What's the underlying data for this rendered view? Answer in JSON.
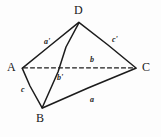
{
  "figure": {
    "name": "tetrahedron-abcd-diagram",
    "style": "hand-drawn pencil line diagram",
    "background_color": "#fdfdfd",
    "ink_color": "#1c1c1c",
    "canvas": {
      "width": 161,
      "height": 137
    }
  },
  "vertices": [
    {
      "id": "A",
      "label": "A",
      "x": 22,
      "y": 68,
      "label_x": 7,
      "label_y": 61
    },
    {
      "id": "B",
      "label": "B",
      "x": 42,
      "y": 108,
      "label_x": 36,
      "label_y": 112
    },
    {
      "id": "C",
      "label": "C",
      "x": 136,
      "y": 68,
      "label_x": 142,
      "label_y": 61
    },
    {
      "id": "D",
      "label": "D",
      "x": 79,
      "y": 22,
      "label_x": 74,
      "label_y": 4
    }
  ],
  "edges": [
    {
      "id": "AD",
      "from": "A",
      "to": "D",
      "style": "solid",
      "label": "a'"
    },
    {
      "id": "DC",
      "from": "D",
      "to": "C",
      "style": "solid",
      "label": "c'"
    },
    {
      "id": "AC",
      "from": "A",
      "to": "C",
      "style": "dashed",
      "label": "b"
    },
    {
      "id": "BD",
      "from": "B",
      "to": "D",
      "style": "solid",
      "label": "b'"
    },
    {
      "id": "AB",
      "from": "A",
      "to": "B",
      "style": "solid",
      "label": "c"
    },
    {
      "id": "BC",
      "from": "B",
      "to": "C",
      "style": "solid",
      "label": "a"
    }
  ],
  "edge_labels": [
    {
      "for_edge": "AD",
      "text": "a'",
      "x": 44,
      "y": 38
    },
    {
      "for_edge": "DC",
      "text": "c'",
      "x": 112,
      "y": 36
    },
    {
      "for_edge": "AC",
      "text": "b",
      "x": 90,
      "y": 56
    },
    {
      "for_edge": "BD",
      "text": "b'",
      "x": 57,
      "y": 74
    },
    {
      "for_edge": "AB",
      "text": "c",
      "x": 21,
      "y": 86
    },
    {
      "for_edge": "BC",
      "text": "a",
      "x": 90,
      "y": 96
    }
  ],
  "caption": {
    "text": "",
    "visible_fragment": "clipped caption marks",
    "x": 55,
    "y": 128
  }
}
